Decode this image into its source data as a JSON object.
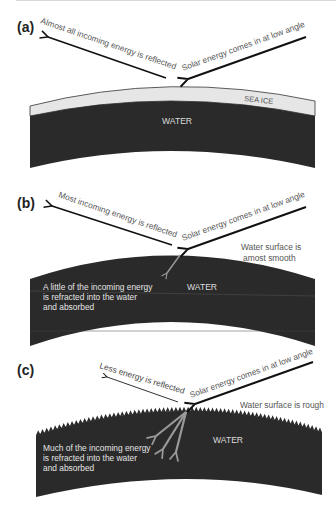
{
  "panels": [
    {
      "id": "a",
      "label": "(a)",
      "reflected_text": "Almost all incoming energy is reflected",
      "incoming_text": "Solar energy comes in at low angle",
      "layer_label": "SEA ICE",
      "water_label": "WATER"
    },
    {
      "id": "b",
      "label": "(b)",
      "reflected_text": "Most incoming energy is reflected",
      "incoming_text": "Solar energy comes in at low angle",
      "surface_note": [
        "Water surface is",
        "amost smooth"
      ],
      "water_label": "WATER",
      "refraction_note": [
        "A little of the incoming energy",
        " is refracted into the water",
        "and absorbed"
      ]
    },
    {
      "id": "c",
      "label": "(c)",
      "reflected_text": "Less energy is reflected",
      "incoming_text": "Solar energy comes in at low angle",
      "surface_note": "Water surface is rough",
      "water_label": "WATER",
      "refraction_note": [
        "Much of the incoming energy",
        " is refracted into the water",
        "and absorbed"
      ]
    }
  ],
  "colors": {
    "water": "#2a2a2a",
    "ice": "#e6e6e6",
    "arrow": "#111111",
    "refract_arrow": "#9a9a9a",
    "text": "#555555"
  }
}
